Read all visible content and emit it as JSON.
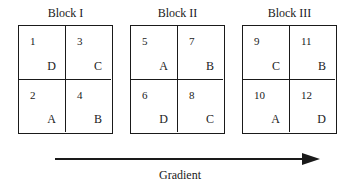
{
  "blocks": [
    {
      "title": "Block I",
      "cells": [
        {
          "plot": "1",
          "treatment": "D"
        },
        {
          "plot": "3",
          "treatment": "C"
        },
        {
          "plot": "2",
          "treatment": "A"
        },
        {
          "plot": "4",
          "treatment": "B"
        }
      ]
    },
    {
      "title": "Block II",
      "cells": [
        {
          "plot": "5",
          "treatment": "A"
        },
        {
          "plot": "7",
          "treatment": "B"
        },
        {
          "plot": "6",
          "treatment": "D"
        },
        {
          "plot": "8",
          "treatment": "C"
        }
      ]
    },
    {
      "title": "Block III",
      "cells": [
        {
          "plot": "9",
          "treatment": "C"
        },
        {
          "plot": "11",
          "treatment": "B"
        },
        {
          "plot": "10",
          "treatment": "A"
        },
        {
          "plot": "12",
          "treatment": "D"
        }
      ]
    }
  ],
  "arrow": {
    "label": "Gradient",
    "direction": "right",
    "color": "#1a1a1a"
  }
}
